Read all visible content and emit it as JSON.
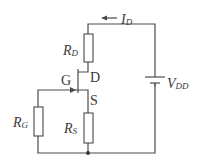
{
  "diagram": {
    "type": "circuit",
    "title": "",
    "colors": {
      "wire": "#4a4a4a",
      "text": "#3a3a3a",
      "background": "#ffffff"
    },
    "components": {
      "rd": {
        "main": "R",
        "sub": "D"
      },
      "rg": {
        "main": "R",
        "sub": "G"
      },
      "rs": {
        "main": "R",
        "sub": "S"
      },
      "vdd": {
        "main": "V",
        "sub": "DD"
      },
      "id": {
        "main": "I",
        "sub": "D"
      }
    },
    "terminals": {
      "gate": "G",
      "drain": "D",
      "source": "S"
    }
  }
}
